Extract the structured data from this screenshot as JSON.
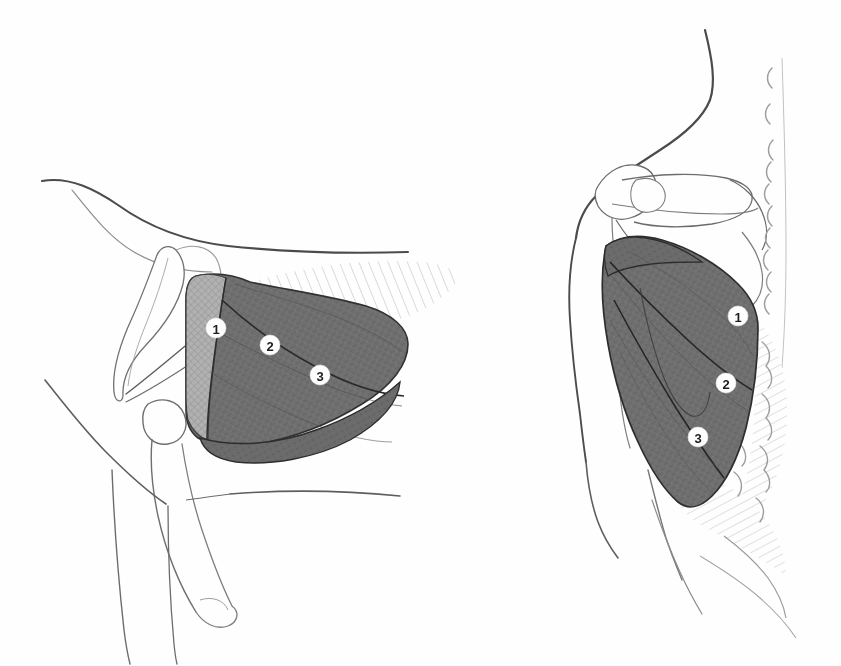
{
  "figure": {
    "background_color": "#ffffff",
    "ink_color": "#3a3a3a",
    "dark_muscle_color": "#6e6e6e",
    "light_muscle_color": "#a9a9a9",
    "hatch_color": "#b4b4b4",
    "label_circle_fill": "#ffffff",
    "label_text_color": "#1a1a1a",
    "width": 841,
    "height": 666
  },
  "panels": [
    {
      "id": "left-panel",
      "name": "lateral-sagittal-view",
      "view_label": "",
      "labels": [
        {
          "id": "left-label-1",
          "text": "1",
          "x": 216,
          "y": 328,
          "region": "clavicular-head"
        },
        {
          "id": "left-label-2",
          "text": "2",
          "x": 270,
          "y": 345,
          "region": "sternocostal-head"
        },
        {
          "id": "left-label-3",
          "text": "3",
          "x": 320,
          "y": 375,
          "region": "abdominal-part"
        }
      ]
    },
    {
      "id": "right-panel",
      "name": "posterior-scapular-view",
      "view_label": "",
      "labels": [
        {
          "id": "right-label-1",
          "text": "1",
          "x": 738,
          "y": 316,
          "region": "clavicular-head"
        },
        {
          "id": "right-label-2",
          "text": "2",
          "x": 726,
          "y": 383,
          "region": "sternocostal-head"
        },
        {
          "id": "right-label-3",
          "text": "3",
          "x": 698,
          "y": 437,
          "region": "abdominal-part"
        }
      ]
    }
  ],
  "legend_items": [
    {
      "number": "1",
      "label": ""
    },
    {
      "number": "2",
      "label": ""
    },
    {
      "number": "3",
      "label": ""
    }
  ]
}
